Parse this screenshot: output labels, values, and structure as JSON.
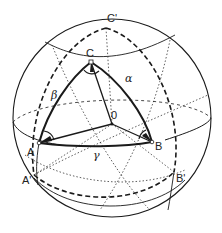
{
  "figure": {
    "type": "spherical-triangle-diagram",
    "colors": {
      "ink": "#1a1a1a",
      "background": "#ffffff"
    },
    "sphere": {
      "center": "O"
    },
    "points": {
      "A": "A",
      "B": "B",
      "C": "C",
      "A_prime": "A'",
      "B_prime": "B'",
      "C_prime": "C'",
      "O": "0"
    },
    "sides": {
      "alpha": "α",
      "beta": "β",
      "gamma": "γ"
    }
  }
}
